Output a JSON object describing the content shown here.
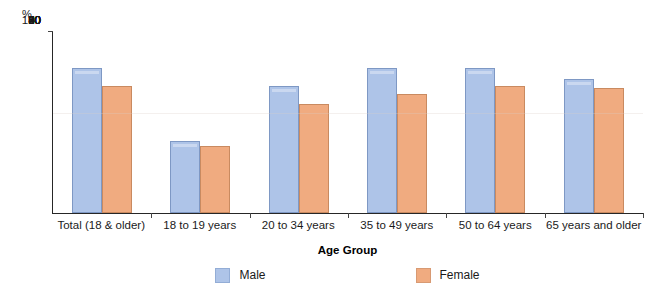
{
  "chart_data": {
    "type": "bar",
    "title": "",
    "xlabel": "Age Group",
    "ylabel": "%",
    "ylim": [
      0,
      100
    ],
    "ytick_step": 10,
    "yticks": [
      0,
      10,
      20,
      30,
      40,
      50,
      60,
      70,
      80,
      90,
      100
    ],
    "grid": false,
    "legend_position": "bottom",
    "categories": [
      "Total (18 & older)",
      "18 to 19 years",
      "20 to 34 years",
      "35 to 49 years",
      "50 to 64 years",
      "65 years and older"
    ],
    "series": [
      {
        "name": "Male",
        "color": "#aec4e8",
        "values": [
          80,
          40,
          70,
          80,
          80,
          74
        ]
      },
      {
        "name": "Female",
        "color": "#f0ab80",
        "values": [
          70,
          37,
          60,
          66,
          70,
          69
        ]
      }
    ]
  },
  "legend": {
    "items": [
      {
        "label": "Male"
      },
      {
        "label": "Female"
      }
    ]
  }
}
